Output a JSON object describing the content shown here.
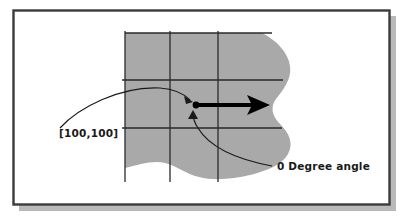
{
  "figure": {
    "title_present": false,
    "frame": {
      "border_color": "#3b3b3b",
      "fill_color": "#ffffff",
      "shadow_color": "#b5b5b5",
      "x": 13,
      "y": 10,
      "width": 377,
      "height": 195
    },
    "blob": {
      "name": "irregular-region",
      "fill_color": "#a9a9a9",
      "description": "shaded irregular amoeba-shaped region"
    },
    "grid": {
      "line_color": "#2a2a2a",
      "vertical_x": [
        125,
        170,
        218
      ],
      "horizontal_y": [
        33,
        80,
        128
      ],
      "vertical_extent": [
        29,
        182
      ],
      "horizontal_extent": [
        122,
        282
      ]
    },
    "origin_point": {
      "name": "origin-dot",
      "x": 196,
      "y": 105,
      "color": "#000000",
      "radius": 3.4
    },
    "direction_arrow": {
      "name": "zero-degree-arrow",
      "from_x": 197,
      "from_y": 105,
      "to_x": 270,
      "to_y": 105,
      "color": "#000000",
      "thickness": 4
    },
    "annotations": [
      {
        "id": "coordinate-label",
        "label": "[100,100]",
        "text_x": 59,
        "text_y": 137,
        "leader": "M 60 128 C 78 108, 120 86, 160 88 C 175 89, 184 94, 190 100",
        "arrow_tip_x": 193,
        "arrow_tip_y": 102,
        "arrow_angle_deg": 42
      },
      {
        "id": "angle-label",
        "label": "0 Degree angle",
        "text_x": 277,
        "text_y": 170,
        "leader": "M 272 166 C 240 160, 210 148, 198 128 C 194 122, 193 117, 193 113",
        "arrow_tip_x": 193,
        "arrow_tip_y": 110,
        "arrow_angle_deg": -90
      }
    ]
  }
}
